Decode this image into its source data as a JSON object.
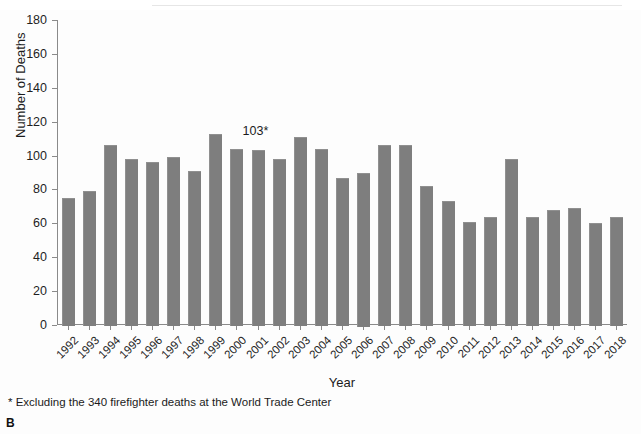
{
  "figure": {
    "panel_label": "B",
    "footnote": "* Excluding the 340 firefighter deaths at the World Trade Center"
  },
  "chart_data": {
    "type": "bar",
    "title": "",
    "subtitle": "",
    "xlabel": "Year",
    "ylabel": "Number of Deaths",
    "ylim": [
      0,
      180
    ],
    "ytick_step": 20,
    "yticks": [
      "0",
      "20",
      "40",
      "60",
      "80",
      "100",
      "120",
      "140",
      "160",
      "180"
    ],
    "grid": false,
    "legend": "none",
    "bar_color": "#7e7e7e",
    "categories": [
      "1992",
      "1993",
      "1994",
      "1995",
      "1996",
      "1997",
      "1998",
      "1999",
      "2000",
      "2001",
      "2002",
      "2003",
      "2004",
      "2005",
      "2006",
      "2007",
      "2008",
      "2009",
      "2010",
      "2011",
      "2012",
      "2013",
      "2014",
      "2015",
      "2016",
      "2017",
      "2018"
    ],
    "values": [
      75,
      79,
      106,
      98,
      96,
      99,
      91,
      113,
      104,
      103,
      98,
      111,
      104,
      87,
      90,
      106,
      106,
      82,
      73,
      61,
      64,
      98,
      64,
      68,
      69,
      60,
      64
    ],
    "annotations": [
      {
        "category": "2001",
        "text": "103*",
        "value": 103
      }
    ]
  }
}
